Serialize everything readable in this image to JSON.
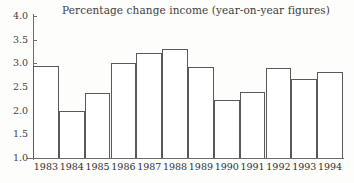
{
  "chart_data": {
    "type": "bar",
    "title": "Percentage change income (year-on-year figures)",
    "xlabel": "",
    "ylabel": "",
    "ylim": [
      1.0,
      4.0
    ],
    "yticks": [
      "4.0",
      "3.5",
      "3.0",
      "2.5",
      "2.0",
      "1.5",
      "1.0"
    ],
    "ytick_values": [
      4.0,
      3.5,
      3.0,
      2.5,
      2.0,
      1.5,
      1.0
    ],
    "grid": false,
    "legend": "none",
    "categories": [
      "1983",
      "1984",
      "1985",
      "1986",
      "1987",
      "1988",
      "1989",
      "1990",
      "1991",
      "1992",
      "1993",
      "1994"
    ],
    "values": [
      2.95,
      2.0,
      2.38,
      3.0,
      3.22,
      3.3,
      2.93,
      2.23,
      2.4,
      2.9,
      2.66,
      2.81
    ],
    "colors": {
      "bar_fill": "#ffffff",
      "bar_outline": "#595959",
      "axis": "#6d6d6d",
      "text": "#2f2f2f",
      "background": "#fdfdfc"
    }
  }
}
